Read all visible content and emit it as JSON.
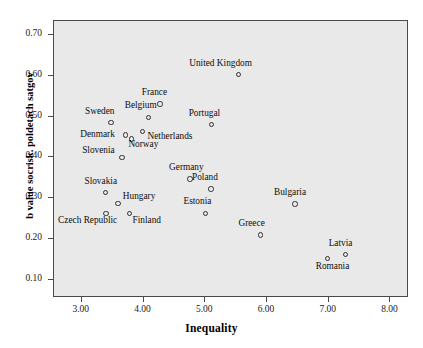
{
  "chart_data": {
    "type": "scatter",
    "title": "",
    "xlabel": "Inequality",
    "ylabel": "b value socrisk. poldetach satgov",
    "xlim": [
      2.55,
      8.3
    ],
    "ylim": [
      0.055,
      0.735
    ],
    "xticks": [
      "3.00",
      "4.00",
      "5.00",
      "6.00",
      "7.00",
      "8.00"
    ],
    "xtick_values": [
      3.0,
      4.0,
      5.0,
      6.0,
      7.0,
      8.0
    ],
    "yticks": [
      "0.10",
      "0.20",
      "0.30",
      "0.40",
      "0.50",
      "0.60",
      "0.70"
    ],
    "ytick_values": [
      0.1,
      0.2,
      0.3,
      0.4,
      0.5,
      0.6,
      0.7
    ],
    "grid": false,
    "legend": "none",
    "plot_background": "#e9e9e9",
    "marker_color": "#2e2e2e",
    "points": [
      {
        "label": "United Kingdom",
        "x": 5.55,
        "y": 0.601,
        "lx": -49,
        "ly": -16
      },
      {
        "label": "France",
        "x": 4.28,
        "y": 0.529,
        "lx": -18,
        "ly": -16
      },
      {
        "label": "Belgium",
        "x": 4.1,
        "y": 0.496,
        "lx": -24,
        "ly": -16
      },
      {
        "label": "Sweden",
        "x": 3.49,
        "y": 0.483,
        "lx": -26,
        "ly": -16
      },
      {
        "label": "Portugal",
        "x": 5.12,
        "y": 0.478,
        "lx": -23,
        "ly": -16
      },
      {
        "label": "Netherlands",
        "x": 4.0,
        "y": 0.461,
        "lx": 5,
        "ly": 0
      },
      {
        "label": "Denmark",
        "x": 3.72,
        "y": 0.453,
        "lx": -45,
        "ly": -5
      },
      {
        "label": "Norway",
        "x": 3.82,
        "y": 0.443,
        "lx": -3,
        "ly": 1
      },
      {
        "label": "Slovenia",
        "x": 3.67,
        "y": 0.397,
        "lx": -40,
        "ly": -12
      },
      {
        "label": "Germany",
        "x": 4.77,
        "y": 0.345,
        "lx": -21,
        "ly": -16
      },
      {
        "label": "Poland",
        "x": 5.11,
        "y": 0.32,
        "lx": -19,
        "ly": -16
      },
      {
        "label": "Bulgaria",
        "x": 6.47,
        "y": 0.283,
        "lx": -21,
        "ly": -16
      },
      {
        "label": "Slovakia",
        "x": 3.4,
        "y": 0.311,
        "lx": -21,
        "ly": -16
      },
      {
        "label": "Hungary",
        "x": 3.6,
        "y": 0.284,
        "lx": 5,
        "ly": -12
      },
      {
        "label": "Estonia",
        "x": 5.02,
        "y": 0.26,
        "lx": -22,
        "ly": -16
      },
      {
        "label": "Czech Republic",
        "x": 3.41,
        "y": 0.26,
        "lx": -48,
        "ly": 3
      },
      {
        "label": "Finland",
        "x": 3.79,
        "y": 0.26,
        "lx": 3,
        "ly": 3
      },
      {
        "label": "Greece",
        "x": 5.91,
        "y": 0.207,
        "lx": -22,
        "ly": -16
      },
      {
        "label": "Latvia",
        "x": 7.29,
        "y": 0.159,
        "lx": -17,
        "ly": -16
      },
      {
        "label": "Romania",
        "x": 7.0,
        "y": 0.149,
        "lx": -12,
        "ly": 3
      }
    ]
  }
}
